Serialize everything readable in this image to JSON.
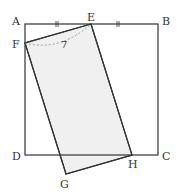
{
  "diagram": {
    "type": "geometry",
    "points": {
      "A": {
        "label": "A",
        "x": 25,
        "y": 24
      },
      "B": {
        "label": "B",
        "x": 158,
        "y": 24
      },
      "C": {
        "label": "C",
        "x": 158,
        "y": 155
      },
      "D": {
        "label": "D",
        "x": 25,
        "y": 155
      },
      "E": {
        "label": "E",
        "x": 91,
        "y": 24
      },
      "F": {
        "label": "F",
        "x": 25,
        "y": 43
      },
      "G": {
        "label": "G",
        "x": 66,
        "y": 174
      },
      "H": {
        "label": "H",
        "x": 132,
        "y": 155
      }
    },
    "arc_label": "7",
    "tick_marks": "AE = EB",
    "colors": {
      "stroke": "#333333",
      "fill": "#f0f0f0",
      "dashed": "#888888"
    }
  }
}
